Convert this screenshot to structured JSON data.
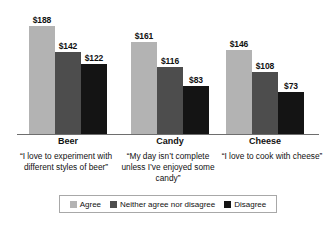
{
  "chart_data": {
    "type": "bar",
    "title": "",
    "subtitle": "",
    "xlabel": "",
    "ylabel": "",
    "ylim": [
      0,
      188
    ],
    "grid": false,
    "legend_position": "bottom",
    "value_prefix": "$",
    "categories": [
      "Beer",
      "Candy",
      "Cheese"
    ],
    "category_quotes": [
      "“I love to experiment with different styles of beer”",
      "“My day isn’t complete unless I’ve enjoyed some candy”",
      "“I love to cook with cheese”"
    ],
    "series": [
      {
        "name": "Agree",
        "color": "#b3b3b3",
        "values": [
          188,
          161,
          146
        ],
        "labels": [
          "$188",
          "$161",
          "$146"
        ]
      },
      {
        "name": "Neither agree nor disagree",
        "color": "#4d4d4d",
        "values": [
          142,
          116,
          108
        ],
        "labels": [
          "$142",
          "$116",
          "$108"
        ]
      },
      {
        "name": "Disagree",
        "color": "#141414",
        "values": [
          122,
          83,
          73
        ],
        "labels": [
          "$122",
          "$83",
          "$73"
        ]
      }
    ]
  }
}
